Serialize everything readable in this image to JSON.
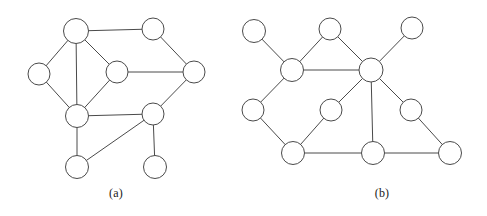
{
  "figure": {
    "background_color": "#ffffff",
    "stroke_color": "#4a4a4a",
    "node_fill_color": "#ffffff",
    "width": 487,
    "height": 216,
    "panels": [
      {
        "id": "a",
        "caption": "(a)",
        "caption_x": 116,
        "caption_y": 192,
        "node_radius": 11,
        "nodes": [
          {
            "id": "a1",
            "cx": 76,
            "cy": 31,
            "r": 12.5
          },
          {
            "id": "a2",
            "cx": 153,
            "cy": 29,
            "r": 11
          },
          {
            "id": "a3",
            "cx": 39,
            "cy": 74,
            "r": 11
          },
          {
            "id": "a4",
            "cx": 117,
            "cy": 72,
            "r": 11
          },
          {
            "id": "a5",
            "cx": 194,
            "cy": 72,
            "r": 11
          },
          {
            "id": "a6",
            "cx": 77,
            "cy": 116,
            "r": 11.5
          },
          {
            "id": "a7",
            "cx": 153,
            "cy": 114,
            "r": 11
          },
          {
            "id": "a8",
            "cx": 77,
            "cy": 167,
            "r": 11.5
          },
          {
            "id": "a9",
            "cx": 155,
            "cy": 167,
            "r": 11.5
          }
        ],
        "edges": [
          {
            "from": "a1",
            "to": "a2"
          },
          {
            "from": "a1",
            "to": "a3"
          },
          {
            "from": "a1",
            "to": "a4"
          },
          {
            "from": "a1",
            "to": "a6"
          },
          {
            "from": "a2",
            "to": "a5"
          },
          {
            "from": "a3",
            "to": "a6"
          },
          {
            "from": "a4",
            "to": "a5"
          },
          {
            "from": "a4",
            "to": "a6"
          },
          {
            "from": "a5",
            "to": "a7"
          },
          {
            "from": "a6",
            "to": "a7"
          },
          {
            "from": "a6",
            "to": "a8"
          },
          {
            "from": "a7",
            "to": "a8"
          },
          {
            "from": "a7",
            "to": "a9"
          }
        ]
      },
      {
        "id": "b",
        "caption": "(b)",
        "caption_x": 382,
        "caption_y": 192,
        "node_radius": 11,
        "nodes": [
          {
            "id": "b1",
            "cx": 254,
            "cy": 31,
            "r": 11.5
          },
          {
            "id": "b2",
            "cx": 330,
            "cy": 29,
            "r": 11
          },
          {
            "id": "b3",
            "cx": 412,
            "cy": 28,
            "r": 11
          },
          {
            "id": "b4",
            "cx": 292,
            "cy": 70,
            "r": 11.5
          },
          {
            "id": "b5",
            "cx": 371,
            "cy": 70,
            "r": 12
          },
          {
            "id": "b6",
            "cx": 253,
            "cy": 110,
            "r": 11
          },
          {
            "id": "b7",
            "cx": 331,
            "cy": 110,
            "r": 11
          },
          {
            "id": "b8",
            "cx": 411,
            "cy": 110,
            "r": 11
          },
          {
            "id": "b9",
            "cx": 293,
            "cy": 153,
            "r": 11.5
          },
          {
            "id": "b10",
            "cx": 373,
            "cy": 153,
            "r": 11.5
          },
          {
            "id": "b11",
            "cx": 450,
            "cy": 153,
            "r": 11.5
          }
        ],
        "edges": [
          {
            "from": "b1",
            "to": "b4"
          },
          {
            "from": "b2",
            "to": "b4"
          },
          {
            "from": "b2",
            "to": "b5"
          },
          {
            "from": "b3",
            "to": "b5"
          },
          {
            "from": "b4",
            "to": "b5"
          },
          {
            "from": "b4",
            "to": "b6"
          },
          {
            "from": "b5",
            "to": "b7"
          },
          {
            "from": "b5",
            "to": "b8"
          },
          {
            "from": "b5",
            "to": "b10"
          },
          {
            "from": "b6",
            "to": "b9"
          },
          {
            "from": "b7",
            "to": "b9"
          },
          {
            "from": "b8",
            "to": "b11"
          },
          {
            "from": "b9",
            "to": "b10"
          },
          {
            "from": "b10",
            "to": "b11"
          }
        ]
      }
    ]
  }
}
